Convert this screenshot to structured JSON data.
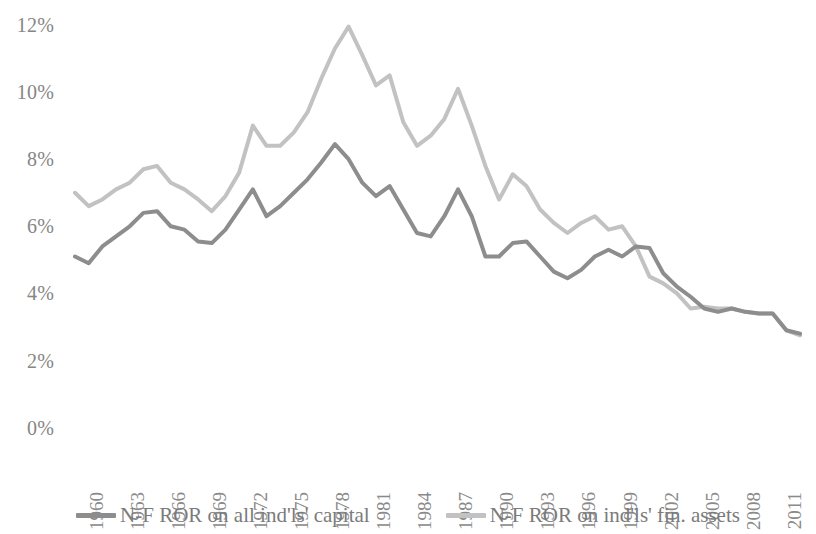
{
  "chart_data": {
    "type": "line",
    "title": "",
    "subtitle": "",
    "xlabel": "",
    "ylabel": "",
    "grid": false,
    "legend_position": "bottom",
    "ylim": [
      0,
      12.4
    ],
    "ytick_values": [
      12,
      10,
      8,
      6,
      4,
      2,
      0
    ],
    "ytick_labels": [
      "12%",
      "10%",
      "8%",
      "6%",
      "4%",
      "2%",
      "0%"
    ],
    "xlim": [
      1960,
      2013
    ],
    "xtick_labels": [
      "1960",
      "1963",
      "1966",
      "1969",
      "1972",
      "1975",
      "1978",
      "1981",
      "1984",
      "1987",
      "1990",
      "1993",
      "1996",
      "1999",
      "2002",
      "2005",
      "2008",
      "2011"
    ],
    "x": [
      1960,
      1961,
      1962,
      1963,
      1964,
      1965,
      1966,
      1967,
      1968,
      1969,
      1970,
      1971,
      1972,
      1973,
      1974,
      1975,
      1976,
      1977,
      1978,
      1979,
      1980,
      1981,
      1982,
      1983,
      1984,
      1985,
      1986,
      1987,
      1988,
      1989,
      1990,
      1991,
      1992,
      1993,
      1994,
      1995,
      1996,
      1997,
      1998,
      1999,
      2000,
      2001,
      2002,
      2003,
      2004,
      2005,
      2006,
      2007,
      2008,
      2009,
      2010,
      2011,
      2012,
      2013
    ],
    "series": [
      {
        "name": "N-F ROR on all ind'ls' capital",
        "color": "#8d8d8d",
        "values": [
          5.1,
          4.9,
          5.4,
          5.7,
          6.0,
          6.4,
          6.45,
          6.0,
          5.9,
          5.55,
          5.5,
          5.9,
          6.5,
          7.1,
          6.3,
          6.6,
          7.0,
          7.4,
          7.9,
          8.45,
          8.0,
          7.3,
          6.9,
          7.2,
          6.5,
          5.8,
          5.7,
          6.3,
          7.1,
          6.3,
          5.1,
          5.1,
          5.5,
          5.55,
          5.1,
          4.65,
          4.45,
          4.7,
          5.1,
          5.3,
          5.1,
          5.4,
          5.35,
          4.6,
          4.2,
          3.9,
          3.55,
          3.45,
          3.55,
          3.45,
          3.4,
          3.4,
          2.9,
          2.8
        ]
      },
      {
        "name": "N-F ROR on ind'ls' fin. assets",
        "color": "#c2c2c2",
        "values": [
          7.0,
          6.6,
          6.8,
          7.1,
          7.3,
          7.7,
          7.8,
          7.3,
          7.1,
          6.8,
          6.45,
          6.9,
          7.6,
          9.0,
          8.4,
          8.4,
          8.8,
          9.4,
          10.4,
          11.3,
          11.95,
          11.1,
          10.2,
          10.5,
          9.1,
          8.4,
          8.7,
          9.2,
          10.1,
          9.0,
          7.8,
          6.8,
          7.55,
          7.2,
          6.5,
          6.1,
          5.8,
          6.1,
          6.3,
          5.9,
          6.0,
          5.4,
          4.5,
          4.3,
          4.0,
          3.55,
          3.6,
          3.55,
          3.55,
          3.45,
          3.4,
          3.4,
          2.9,
          2.75
        ]
      }
    ]
  },
  "yaxis": {
    "ticks": [
      {
        "label": "12%",
        "value": 12
      },
      {
        "label": "10%",
        "value": 10
      },
      {
        "label": "8%",
        "value": 8
      },
      {
        "label": "6%",
        "value": 6
      },
      {
        "label": "4%",
        "value": 4
      },
      {
        "label": "2%",
        "value": 2
      },
      {
        "label": "0%",
        "value": 0
      }
    ]
  },
  "xaxis": {
    "ticks": [
      {
        "label": "1960"
      },
      {
        "label": "1963"
      },
      {
        "label": "1966"
      },
      {
        "label": "1969"
      },
      {
        "label": "1972"
      },
      {
        "label": "1975"
      },
      {
        "label": "1978"
      },
      {
        "label": "1981"
      },
      {
        "label": "1984"
      },
      {
        "label": "1987"
      },
      {
        "label": "1990"
      },
      {
        "label": "1993"
      },
      {
        "label": "1996"
      },
      {
        "label": "1999"
      },
      {
        "label": "2002"
      },
      {
        "label": "2005"
      },
      {
        "label": "2008"
      },
      {
        "label": "2011"
      }
    ]
  },
  "legend": {
    "items": [
      {
        "label": "N-F ROR on all ind'ls' capital",
        "color": "#8d8d8d"
      },
      {
        "label": "N-F ROR on ind'ls' fin. assets",
        "color": "#c2c2c2"
      }
    ]
  }
}
